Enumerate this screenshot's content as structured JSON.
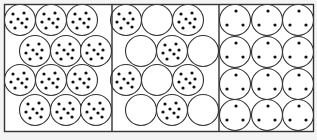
{
  "diagram": {
    "frame": {
      "x": 4.5,
      "y": 4.5,
      "w": 309,
      "h": 127
    },
    "stroke": "#333333",
    "fill": "#ffffff",
    "dot_color": "#111111",
    "circle_radius": 15.5,
    "dot_radius": 1.6,
    "dividers": [
      112,
      219
    ],
    "panels": [
      {
        "name": "panel-1-packed-many-dots",
        "circles": [
          {
            "cx": 20,
            "cy": 20,
            "dots": 8
          },
          {
            "cx": 51,
            "cy": 20,
            "dots": 8
          },
          {
            "cx": 82,
            "cy": 20,
            "dots": 8
          },
          {
            "cx": 35,
            "cy": 51,
            "dots": 8
          },
          {
            "cx": 66,
            "cy": 51,
            "dots": 8
          },
          {
            "cx": 96,
            "cy": 51,
            "dots": 8
          },
          {
            "cx": 20,
            "cy": 80,
            "dots": 8
          },
          {
            "cx": 51,
            "cy": 80,
            "dots": 8
          },
          {
            "cx": 82,
            "cy": 80,
            "dots": 8
          },
          {
            "cx": 35,
            "cy": 110,
            "dots": 8
          },
          {
            "cx": 66,
            "cy": 110,
            "dots": 8
          },
          {
            "cx": 96,
            "cy": 110,
            "dots": 8
          }
        ]
      },
      {
        "name": "panel-2-packed-mixed",
        "circles": [
          {
            "cx": 126,
            "cy": 20,
            "dots": 8
          },
          {
            "cx": 157,
            "cy": 20,
            "dots": 0
          },
          {
            "cx": 188,
            "cy": 20,
            "dots": 8
          },
          {
            "cx": 141,
            "cy": 51,
            "dots": 0
          },
          {
            "cx": 172,
            "cy": 51,
            "dots": 8
          },
          {
            "cx": 203,
            "cy": 51,
            "dots": 0
          },
          {
            "cx": 126,
            "cy": 80,
            "dots": 8
          },
          {
            "cx": 157,
            "cy": 80,
            "dots": 0
          },
          {
            "cx": 188,
            "cy": 80,
            "dots": 8
          },
          {
            "cx": 141,
            "cy": 110,
            "dots": 0
          },
          {
            "cx": 172,
            "cy": 110,
            "dots": 8
          },
          {
            "cx": 203,
            "cy": 110,
            "dots": 0
          }
        ]
      },
      {
        "name": "panel-3-grid-three-dots",
        "circles": [
          {
            "cx": 235,
            "cy": 20,
            "dots": 3
          },
          {
            "cx": 267,
            "cy": 20,
            "dots": 3
          },
          {
            "cx": 298,
            "cy": 20,
            "dots": 3
          },
          {
            "cx": 235,
            "cy": 52,
            "dots": 3
          },
          {
            "cx": 267,
            "cy": 52,
            "dots": 3
          },
          {
            "cx": 298,
            "cy": 52,
            "dots": 3
          },
          {
            "cx": 235,
            "cy": 84,
            "dots": 3
          },
          {
            "cx": 267,
            "cy": 84,
            "dots": 3
          },
          {
            "cx": 298,
            "cy": 84,
            "dots": 3
          },
          {
            "cx": 235,
            "cy": 115,
            "dots": 3
          },
          {
            "cx": 267,
            "cy": 115,
            "dots": 3
          },
          {
            "cx": 298,
            "cy": 115,
            "dots": 3
          }
        ]
      }
    ],
    "dot_patterns": {
      "8": [
        [
          -7,
          -6
        ],
        [
          4,
          -7
        ],
        [
          -2,
          -1
        ],
        [
          7,
          -1
        ],
        [
          -9,
          2
        ],
        [
          2,
          3
        ],
        [
          -5,
          8
        ],
        [
          6,
          7
        ]
      ],
      "3": [
        [
          1,
          -9
        ],
        [
          -8,
          5
        ],
        [
          8,
          5
        ]
      ],
      "0": []
    }
  }
}
